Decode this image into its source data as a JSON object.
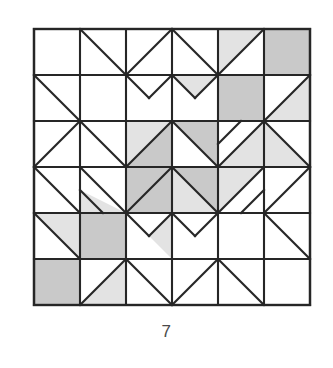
{
  "figure": {
    "caption": "7",
    "grid": {
      "rows": 6,
      "cols": 6,
      "cell": 46,
      "origin_x": 34,
      "origin_y": 29
    },
    "colors": {
      "background": "#ffffff",
      "line": "#262626",
      "fill_shaded": "#c9c9c9",
      "fill_light": "#e3e3e3",
      "fill_plain": "#ffffff",
      "caption_text": "#4a4a4a"
    },
    "line_width": 2.1,
    "border_width": 2.4,
    "cells": [
      {
        "r": 0,
        "c": 0,
        "type": "plain",
        "fill": "plain"
      },
      {
        "r": 0,
        "c": 1,
        "type": "diag-tlbr",
        "fill_a": "plain",
        "fill_b": "plain"
      },
      {
        "r": 0,
        "c": 2,
        "type": "diag-trbl",
        "fill_a": "plain",
        "fill_b": "plain"
      },
      {
        "r": 0,
        "c": 3,
        "type": "diag-tlbr",
        "fill_a": "plain",
        "fill_b": "plain"
      },
      {
        "r": 0,
        "c": 4,
        "type": "diag-trbl",
        "fill_a": "light",
        "fill_b": "plain"
      },
      {
        "r": 0,
        "c": 5,
        "type": "plain",
        "fill": "shaded"
      },
      {
        "r": 1,
        "c": 0,
        "type": "diag-tlbr",
        "fill_a": "plain",
        "fill_b": "plain"
      },
      {
        "r": 1,
        "c": 1,
        "type": "plain",
        "fill": "plain"
      },
      {
        "r": 1,
        "c": 2,
        "type": "qst-half-right",
        "fill_a": "plain",
        "fill_b": "plain"
      },
      {
        "r": 1,
        "c": 3,
        "type": "qst-half-left",
        "fill_a": "light",
        "fill_b": "plain"
      },
      {
        "r": 1,
        "c": 4,
        "type": "plain",
        "fill": "shaded"
      },
      {
        "r": 1,
        "c": 5,
        "type": "diag-trbl",
        "fill_a": "plain",
        "fill_b": "light"
      },
      {
        "r": 2,
        "c": 0,
        "type": "diag-trbl",
        "fill_a": "plain",
        "fill_b": "plain"
      },
      {
        "r": 2,
        "c": 1,
        "type": "diag-tlbr",
        "fill_a": "plain",
        "fill_b": "plain"
      },
      {
        "r": 2,
        "c": 2,
        "type": "diag-trbl",
        "fill_a": "light",
        "fill_b": "shaded"
      },
      {
        "r": 2,
        "c": 3,
        "type": "diag-tlbr",
        "fill_a": "shaded",
        "fill_b": "plain"
      },
      {
        "r": 2,
        "c": 4,
        "type": "small-nest-tr",
        "fill_a": "plain",
        "fill_b": "light"
      },
      {
        "r": 2,
        "c": 5,
        "type": "diag-tlbr",
        "fill_a": "plain",
        "fill_b": "light"
      },
      {
        "r": 3,
        "c": 0,
        "type": "diag-tlbr",
        "fill_a": "plain",
        "fill_b": "plain"
      },
      {
        "r": 3,
        "c": 1,
        "type": "small-nest-br",
        "fill_a": "plain",
        "fill_b": "light"
      },
      {
        "r": 3,
        "c": 2,
        "type": "diag-trbl",
        "fill_a": "shaded",
        "fill_b": "shaded"
      },
      {
        "r": 3,
        "c": 3,
        "type": "diag-tlbr",
        "fill_a": "shaded",
        "fill_b": "light"
      },
      {
        "r": 3,
        "c": 4,
        "type": "small-nest-bl",
        "fill_a": "light",
        "fill_b": "plain"
      },
      {
        "r": 3,
        "c": 5,
        "type": "diag-trbl",
        "fill_a": "plain",
        "fill_b": "plain"
      },
      {
        "r": 4,
        "c": 0,
        "type": "diag-tlbr",
        "fill_a": "light",
        "fill_b": "plain"
      },
      {
        "r": 4,
        "c": 1,
        "type": "plain",
        "fill": "shaded"
      },
      {
        "r": 4,
        "c": 2,
        "type": "qst-half-right",
        "fill_a": "plain",
        "fill_b": "light"
      },
      {
        "r": 4,
        "c": 3,
        "type": "qst-half-left",
        "fill_a": "plain",
        "fill_b": "plain"
      },
      {
        "r": 4,
        "c": 4,
        "type": "plain",
        "fill": "plain"
      },
      {
        "r": 4,
        "c": 5,
        "type": "diag-tlbr",
        "fill_a": "plain",
        "fill_b": "plain"
      },
      {
        "r": 5,
        "c": 0,
        "type": "plain",
        "fill": "shaded"
      },
      {
        "r": 5,
        "c": 1,
        "type": "diag-trbl",
        "fill_a": "plain",
        "fill_b": "light"
      },
      {
        "r": 5,
        "c": 2,
        "type": "diag-tlbr",
        "fill_a": "plain",
        "fill_b": "plain"
      },
      {
        "r": 5,
        "c": 3,
        "type": "diag-trbl",
        "fill_a": "plain",
        "fill_b": "plain"
      },
      {
        "r": 5,
        "c": 4,
        "type": "diag-tlbr",
        "fill_a": "plain",
        "fill_b": "plain"
      },
      {
        "r": 5,
        "c": 5,
        "type": "plain",
        "fill": "plain"
      }
    ]
  }
}
